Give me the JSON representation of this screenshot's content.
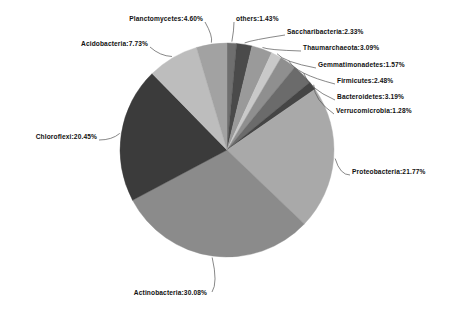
{
  "chart_data": {
    "type": "pie",
    "title": "",
    "subtitle": "",
    "xlabel": "",
    "ylabel": "",
    "legend_position": "none",
    "grid": false,
    "label_format": "name:percent",
    "start_angle_deg": 0,
    "direction": "clockwise",
    "categories": [
      "others",
      "Saccharibacteria",
      "Thaumarchaeota",
      "Gemmatimonadetes",
      "Firmicutes",
      "Bacteroidetes",
      "Verrucomicrobia",
      "Proteobacteria",
      "Actinobacteria",
      "Chloroflexi",
      "Acidobacteria",
      "Planctomycetes"
    ],
    "values": [
      1.43,
      2.33,
      3.09,
      1.57,
      2.48,
      3.19,
      1.28,
      21.77,
      30.08,
      20.45,
      7.73,
      4.6
    ],
    "units": "%",
    "slices": [
      {
        "name": "others",
        "value": 1.43,
        "label": "others:1.43%",
        "color": "#6e6e6e"
      },
      {
        "name": "Saccharibacteria",
        "value": 2.33,
        "label": "Saccharibacteria:2.33%",
        "color": "#4a4a4a"
      },
      {
        "name": "Thaumarchaeota",
        "value": 3.09,
        "label": "Thaumarchaeota:3.09%",
        "color": "#9a9a9a"
      },
      {
        "name": "Gemmatimonadetes",
        "value": 1.57,
        "label": "Gemmatimonadetes:1.57%",
        "color": "#c9c9c9"
      },
      {
        "name": "Firmicutes",
        "value": 2.48,
        "label": "Firmicutes:2.48%",
        "color": "#8f8f8f"
      },
      {
        "name": "Bacteroidetes",
        "value": 3.19,
        "label": "Bacteroidetes:3.19%",
        "color": "#6b6b6b"
      },
      {
        "name": "Verrucomicrobia",
        "value": 1.28,
        "label": "Verrucomicrobia:1.28%",
        "color": "#454545"
      },
      {
        "name": "Proteobacteria",
        "value": 21.77,
        "label": "Proteobacteria:21.77%",
        "color": "#a9a9a9"
      },
      {
        "name": "Actinobacteria",
        "value": 30.08,
        "label": "Actinobacteria:30.08%",
        "color": "#8b8b8b"
      },
      {
        "name": "Chloroflexi",
        "value": 20.45,
        "label": "Chloroflexi:20.45%",
        "color": "#3b3b3b"
      },
      {
        "name": "Acidobacteria",
        "value": 7.73,
        "label": "Acidobacteria:7.73%",
        "color": "#bdbdbd"
      },
      {
        "name": "Planctomycetes",
        "value": 4.6,
        "label": "Planctomycetes:4.60%",
        "color": "#a2a2a2"
      }
    ],
    "geometry": {
      "center_x": 227,
      "center_y": 150,
      "radius": 107
    }
  },
  "labels": {
    "planctomycetes": "Planctomycetes:4.60%",
    "acidobacteria": "Acidobacteria:7.73%",
    "chloroflexi": "Chloroflexi:20.45%",
    "actinobacteria": "Actinobacteria:30.08%",
    "others": "others:1.43%",
    "saccharibacteria": "Saccharibacteria:2.33%",
    "thaumarchaeota": "Thaumarchaeota:3.09%",
    "gemmatimonadetes": "Gemmatimonadetes:1.57%",
    "firmicutes": "Firmicutes:2.48%",
    "bacteroidetes": "Bacteroidetes:3.19%",
    "verrucomicrobia": "Verrucomicrobia:1.28%",
    "proteobacteria": "Proteobacteria:21.77%"
  }
}
